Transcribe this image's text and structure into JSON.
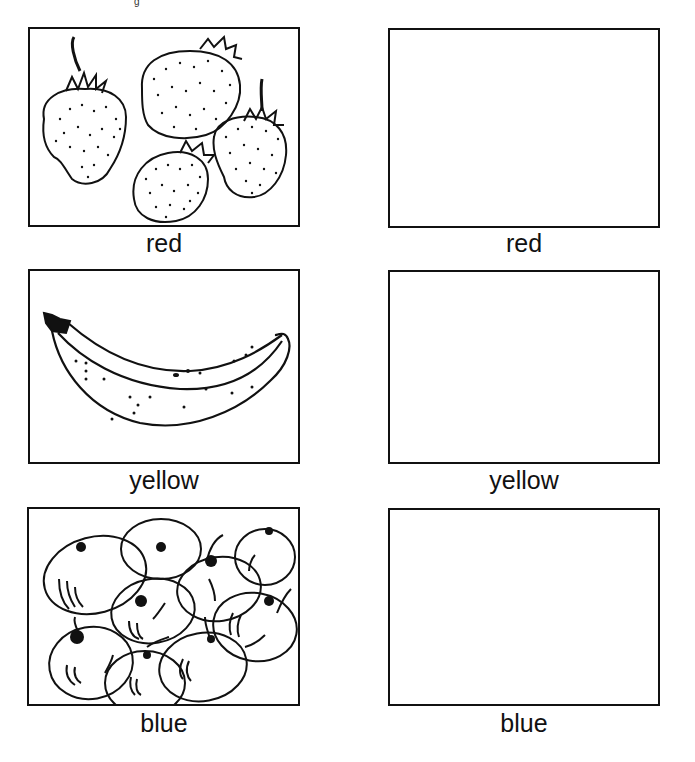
{
  "worksheet": {
    "top_fragment": "g",
    "rows": [
      {
        "picture": "strawberries",
        "left_label": "red",
        "right_label": "red"
      },
      {
        "picture": "banana",
        "left_label": "yellow",
        "right_label": "yellow"
      },
      {
        "picture": "blueberries",
        "left_label": "blue",
        "right_label": "blue"
      }
    ]
  }
}
